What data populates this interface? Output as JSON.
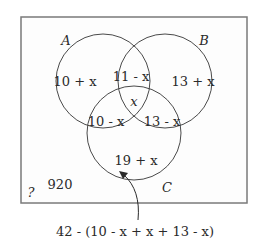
{
  "diagram": {
    "type": "venn-3-sets",
    "universe": {
      "label": "?",
      "outside_value": "920"
    },
    "sets": [
      {
        "name": "A"
      },
      {
        "name": "B"
      },
      {
        "name": "C"
      }
    ],
    "regions": {
      "only_a": "10 + x",
      "only_b": "13 + x",
      "only_c": "19 + x",
      "a_and_b_only": "11 - x",
      "a_and_c_only": "10 - x",
      "b_and_c_only": "13 - x",
      "a_b_c": "x"
    },
    "annotation": {
      "text": "42 - (10 - x + x + 13 - x)",
      "points_to": "only_c"
    },
    "colors": {
      "stroke": "#4a4a4a",
      "frame": "#7a7a7a",
      "text": "#2a2a2a"
    }
  }
}
